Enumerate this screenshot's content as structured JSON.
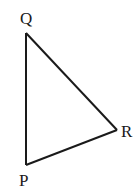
{
  "diagram": {
    "type": "triangle",
    "vertices": [
      {
        "name": "Q",
        "label": "Q"
      },
      {
        "name": "R",
        "label": "R"
      },
      {
        "name": "P",
        "label": "P"
      }
    ],
    "edges": [
      [
        "Q",
        "R"
      ],
      [
        "R",
        "P"
      ],
      [
        "P",
        "Q"
      ]
    ],
    "stroke_color": "#1a1a1a"
  }
}
